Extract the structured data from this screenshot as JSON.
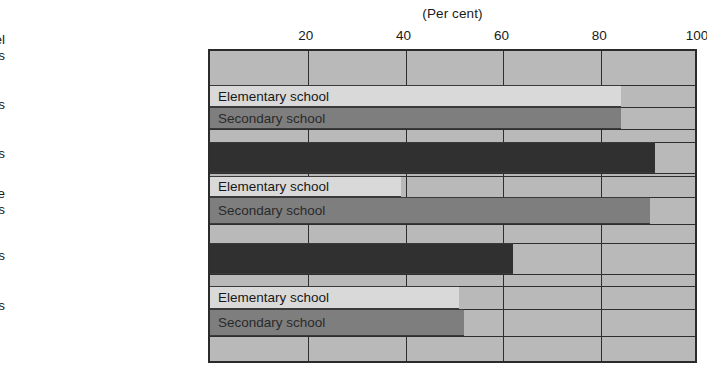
{
  "chart_data": {
    "type": "bar",
    "orientation": "horizontal",
    "title": "",
    "xlabel": "(Per cent)",
    "ylabel": "Professional personnel or services",
    "xlim": [
      0,
      100
    ],
    "xticks": [
      20,
      40,
      60,
      80,
      100
    ],
    "grid": true,
    "legend": "inline bar labels",
    "categories": [
      "Psychologists",
      "Speech therapists",
      "Full-time guidance counselors",
      "School social workers",
      "Psychiatric services"
    ],
    "series": [
      {
        "name": "Elementary school",
        "values": [
          84,
          null,
          39,
          null,
          51
        ]
      },
      {
        "name": "Secondary school",
        "values": [
          84,
          null,
          90,
          null,
          52
        ]
      },
      {
        "name": "Combined",
        "values": [
          null,
          91,
          null,
          62,
          null
        ]
      }
    ],
    "bars": [
      {
        "category": "Psychologists",
        "group": "Elementary school",
        "value": 84,
        "style": "light",
        "label": "Elementary school"
      },
      {
        "category": "Psychologists",
        "group": "Secondary school",
        "value": 84,
        "style": "medium",
        "label": "Secondary school"
      },
      {
        "category": "Speech therapists",
        "group": "Combined",
        "value": 91,
        "style": "dark",
        "label": ""
      },
      {
        "category": "Full-time guidance counselors",
        "group": "Elementary school",
        "value": 39,
        "style": "light",
        "label": "Elementary school"
      },
      {
        "category": "Full-time guidance counselors",
        "group": "Secondary school",
        "value": 90,
        "style": "medium",
        "label": "Secondary school"
      },
      {
        "category": "School social workers",
        "group": "Combined",
        "value": 62,
        "style": "dark",
        "label": ""
      },
      {
        "category": "Psychiatric services",
        "group": "Elementary school",
        "value": 51,
        "style": "light",
        "label": "Elementary school"
      },
      {
        "category": "Psychiatric services",
        "group": "Secondary school",
        "value": 52,
        "style": "medium",
        "label": "Secondary school"
      }
    ],
    "colors": {
      "plot_background": "#b9b9b9",
      "elementary": "#d9d9d9",
      "secondary": "#7e7e7e",
      "combined": "#303030",
      "frame": "#2b2b2b",
      "text": "#1a1a1a"
    }
  },
  "axis": {
    "x_title": "(Per cent)",
    "ticks": [
      {
        "value": 20,
        "label": "20"
      },
      {
        "value": 40,
        "label": "40"
      },
      {
        "value": 60,
        "label": "60"
      },
      {
        "value": 80,
        "label": "80"
      },
      {
        "value": 100,
        "label": "100"
      }
    ]
  },
  "category_labels": [
    {
      "text": "Professional personnel\nor services",
      "top": 32
    },
    {
      "text": "Psychologists",
      "top": 97
    },
    {
      "text": "Speech therapists",
      "top": 146
    },
    {
      "text": "Full-time guidance\ncounselors",
      "top": 186
    },
    {
      "text": "School social workers",
      "top": 248
    },
    {
      "text": "Psychiatric services",
      "top": 298
    }
  ],
  "bar_geometry": [
    {
      "top": 83,
      "height": 22,
      "style": "light",
      "value": 84,
      "label": "Elementary school"
    },
    {
      "top": 105,
      "height": 22,
      "style": "medium",
      "value": 84,
      "label": "Secondary school"
    },
    {
      "top": 140,
      "height": 31,
      "style": "dark",
      "value": 91,
      "label": ""
    },
    {
      "top": 174,
      "height": 21,
      "style": "light",
      "value": 39,
      "label": "Elementary school"
    },
    {
      "top": 195,
      "height": 27,
      "style": "medium",
      "value": 90,
      "label": "Secondary school"
    },
    {
      "top": 241,
      "height": 31,
      "style": "dark",
      "value": 62,
      "label": ""
    },
    {
      "top": 284,
      "height": 23,
      "style": "light",
      "value": 51,
      "label": "Elementary school"
    },
    {
      "top": 307,
      "height": 27,
      "style": "medium",
      "value": 52,
      "label": "Secondary school"
    }
  ]
}
